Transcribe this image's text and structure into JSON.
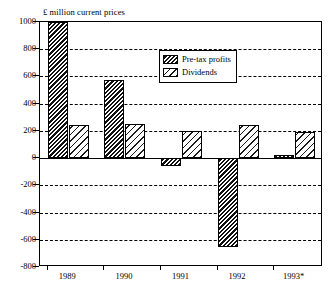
{
  "chart_data": {
    "type": "bar",
    "title": "",
    "axis_title": "£ million current prices",
    "xlabel": "",
    "ylabel": "",
    "categories": [
      "1989",
      "1990",
      "1991",
      "1992",
      "1993*"
    ],
    "series": [
      {
        "name": "Pre-tax profits",
        "values": [
          1000,
          575,
          -55,
          -650,
          20
        ],
        "fill": "dark-diagonal-hatch"
      },
      {
        "name": "Dividends",
        "values": [
          240,
          250,
          200,
          240,
          190
        ],
        "fill": "light-diagonal-hatch"
      }
    ],
    "ylim": [
      -800,
      1000
    ],
    "yticks": [
      1000,
      800,
      600,
      400,
      200,
      0,
      -200,
      -400,
      -600,
      -800
    ],
    "ytick_labels": [
      "1000",
      "800",
      "600",
      "400",
      "200",
      "0",
      "-200",
      "-400",
      "-600",
      "-800"
    ],
    "grid": true,
    "grid_style": "dashed-horizontal",
    "zero_line": true,
    "legend_position": "upper-center",
    "colors": {
      "axis": "#000000",
      "grid": "#000000",
      "background": "#ffffff"
    }
  },
  "legend": {
    "items": [
      {
        "label": "Pre-tax profits"
      },
      {
        "label": "Dividends"
      }
    ]
  }
}
